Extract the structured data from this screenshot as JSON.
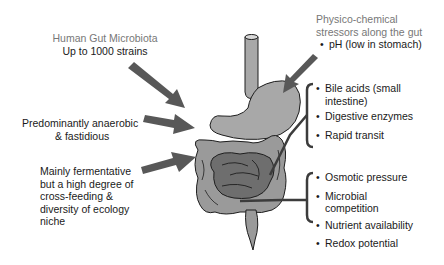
{
  "left_labels": {
    "top_title": "Human Gut Microbiota",
    "top_subtitle": "Up to 1000 strains",
    "middle": [
      "Predominantly anaerobic",
      "& fastidious"
    ],
    "bottom": [
      "Mainly fermentative",
      "but a high degree of",
      "cross-feeding &",
      "diversity of ecology",
      "niche"
    ]
  },
  "right_labels": {
    "header": [
      "Physico-chemical",
      "stressors along the gut"
    ],
    "stomach_item": "pH (low in stomach)",
    "small_intestine_group": [
      "Bile acids (small intestine)",
      "Digestive enzymes",
      "Rapid transit"
    ],
    "colon_group": [
      "Osmotic pressure",
      "Microbial competition",
      "Nutrient availability",
      "Redox potential"
    ]
  },
  "colors": {
    "text": "#1a1a1a",
    "gray_text": "#777777",
    "organ_light": "#a8a8a8",
    "organ_dark": "#6e6e6e",
    "arrow": "#585858",
    "outline": "#1e1e1e"
  }
}
